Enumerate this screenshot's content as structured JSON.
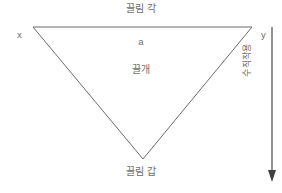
{
  "diagram": {
    "type": "geometry-diagram",
    "background_color": "#ffffff",
    "stroke_color": "#6b6b6b",
    "text_color": "#6e6e6e",
    "labels": {
      "top": "끌림 각",
      "bottom": "끌림 갑",
      "center": "끌개",
      "side": "a",
      "vertex_left": "x",
      "vertex_right": "y",
      "axis_vertical": "수직작용"
    },
    "shape": {
      "name": "inverted-triangle",
      "vertices": [
        {
          "id": "x",
          "x": 33,
          "y": 27
        },
        {
          "id": "y",
          "x": 252,
          "y": 27
        },
        {
          "id": "bottom",
          "x": 143,
          "y": 159
        }
      ]
    },
    "arrow": {
      "name": "downward-arrow",
      "from": {
        "x": 272,
        "y": 27
      },
      "to": {
        "x": 272,
        "y": 181
      },
      "direction": "down"
    }
  }
}
